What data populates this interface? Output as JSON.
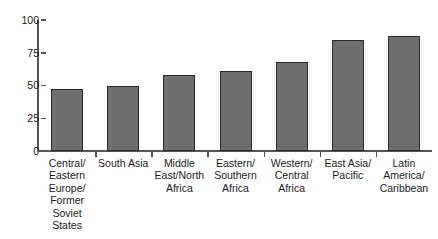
{
  "chart_data": {
    "type": "bar",
    "title": "",
    "subtitle": "",
    "xlabel": "",
    "ylabel": "",
    "ylim": [
      0,
      100
    ],
    "yticks": [
      "0",
      "25",
      "50",
      "75",
      "100"
    ],
    "ytick_values": [
      0,
      25,
      50,
      75,
      100
    ],
    "grid": false,
    "legend": null,
    "orientation": "vertical",
    "bar_color": "#6e6e6e",
    "bar_border_color": "#2b2b2b",
    "axis_color": "#555555",
    "background_color": "#ffffff",
    "categories": [
      "Central/\nEastern\nEurope/\nFormer\nSoviet\nStates",
      "South Asia",
      "Middle\nEast/North\nAfrica",
      "Eastern/\nSouthern\nAfrica",
      "Western/\nCentral\nAfrica",
      "East Asia/\nPacific",
      "Latin\nAmerica/\nCaribbean"
    ],
    "category_lines": [
      [
        "Central/",
        "Eastern",
        "Europe/",
        "Former",
        "Soviet",
        "States"
      ],
      [
        "South Asia"
      ],
      [
        "Middle",
        "East/North",
        "Africa"
      ],
      [
        "Eastern/",
        "Southern",
        "Africa"
      ],
      [
        "Western/",
        "Central",
        "Africa"
      ],
      [
        "East Asia/",
        "Pacific"
      ],
      [
        "Latin",
        "America/",
        "Caribbean"
      ]
    ],
    "values": [
      47,
      50,
      58,
      61,
      68,
      85,
      88
    ]
  }
}
